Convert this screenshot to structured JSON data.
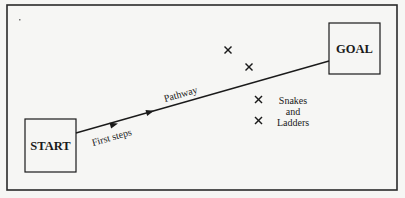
{
  "diagram": {
    "start_label": "START",
    "goal_label": "GOAL",
    "segment_labels": {
      "first": "First steps",
      "second": "Pathway"
    },
    "markers": {
      "symbol": "×",
      "legend_line1": "Snakes",
      "legend_line2": "and",
      "legend_line3": "Ladders"
    },
    "colors": {
      "background": "#f6f6f4",
      "stroke": "#1a1a1a"
    }
  }
}
